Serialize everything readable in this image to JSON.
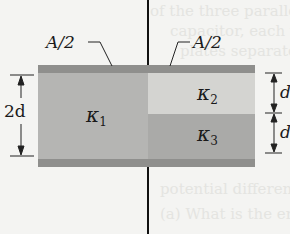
{
  "diagram": {
    "type": "capacitor-with-three-dielectrics",
    "labels": {
      "left_area": "A/2",
      "right_area": "A/2",
      "left_height": "2d",
      "right_top_height": "d",
      "right_bottom_height": "d",
      "kappa1": "κ",
      "kappa1_sub": "1",
      "kappa2": "κ",
      "kappa2_sub": "2",
      "kappa3": "κ",
      "kappa3_sub": "3"
    },
    "colors": {
      "plate": "#8f8f8d",
      "kappa1": "#b5b5b3",
      "kappa2": "#d4d4d1",
      "kappa3": "#aaaaa8",
      "wire": "#111111",
      "background": "#f4f4f2"
    }
  },
  "background_text": [
    "of the three parallel-plate",
    "capacitor, each with",
    "plates separated by",
    "potential difference across",
    "(a) What is the energy"
  ]
}
